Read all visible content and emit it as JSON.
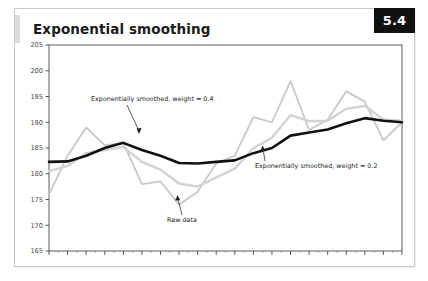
{
  "card": {
    "title": "Exponential smoothing",
    "badge": "5.4",
    "accent_color": "#dcdcdc",
    "badge_bg": "#111111",
    "badge_fg": "#ffffff",
    "border_color": "#c9c9c9"
  },
  "annotations": {
    "smoothed_04": "Exponentially smoothed, weight = 0.4",
    "smoothed_02": "Exponentially smoothed, weight = 0.2",
    "raw": "Raw data"
  },
  "axis": {
    "y_ticks": [
      "205",
      "200",
      "195",
      "190",
      "185",
      "180",
      "175",
      "170",
      "165"
    ]
  },
  "chart_data": {
    "type": "line",
    "title": "Exponential smoothing",
    "xlabel": "",
    "ylabel": "",
    "ylim": [
      165,
      205
    ],
    "xlim": [
      1,
      20
    ],
    "y_ticks": [
      205,
      200,
      195,
      190,
      185,
      180,
      175,
      170,
      165
    ],
    "grid": false,
    "legend": "annotations",
    "x": [
      1,
      2,
      3,
      4,
      5,
      6,
      7,
      8,
      9,
      10,
      11,
      12,
      13,
      14,
      15,
      16,
      17,
      18,
      19,
      20
    ],
    "series": [
      {
        "name": "Raw data",
        "color": "#c8c8c8",
        "width": 1.8,
        "values": [
          176.0,
          183.5,
          189.0,
          185.5,
          186.0,
          178.0,
          178.5,
          174.0,
          176.5,
          182.0,
          183.5,
          191.0,
          190.0,
          198.0,
          188.5,
          190.5,
          196.0,
          194.0,
          186.5,
          190.0
        ]
      },
      {
        "name": "Exponentially smoothed, weight = 0.4",
        "color": "#d2d2d2",
        "width": 2.4,
        "values": [
          180.5,
          181.5,
          184.0,
          184.6,
          185.2,
          182.3,
          180.8,
          178.1,
          177.5,
          179.3,
          181.0,
          185.0,
          187.0,
          191.4,
          190.2,
          190.3,
          192.6,
          193.2,
          190.5,
          190.3
        ]
      },
      {
        "name": "Exponentially smoothed, weight = 0.2",
        "color": "#111111",
        "width": 2.6,
        "values": [
          182.3,
          182.4,
          183.5,
          185.0,
          186.0,
          184.6,
          183.5,
          182.1,
          182.0,
          182.3,
          182.6,
          184.0,
          185.0,
          187.4,
          188.0,
          188.6,
          189.8,
          190.8,
          190.3,
          190.0
        ]
      }
    ]
  }
}
